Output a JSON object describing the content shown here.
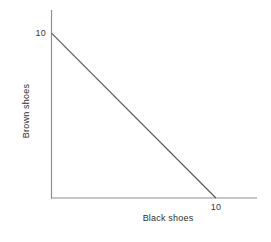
{
  "chart_data": {
    "type": "line",
    "title": "",
    "subtitle": "",
    "xlabel": "Black shoes",
    "ylabel": "Brown shoes",
    "xlim": [
      0,
      12.5
    ],
    "ylim": [
      0,
      11.4
    ],
    "grid": false,
    "legend": null,
    "xticks": [
      {
        "value": 10,
        "label": "10"
      }
    ],
    "yticks": [
      {
        "value": 10,
        "label": "10"
      }
    ],
    "series": [
      {
        "name": "Budget constraint",
        "type": "line",
        "color": "#5a5a5a",
        "linewidth": 1.2,
        "x": [
          0,
          10
        ],
        "y": [
          10,
          0
        ],
        "points": [
          {
            "x": 0,
            "y": 10
          },
          {
            "x": 10,
            "y": 0
          }
        ]
      }
    ],
    "annotations": [],
    "axis_color": "#8f8f8f",
    "background": "#ffffff"
  },
  "axes": {
    "x_tick_10": "10",
    "y_tick_10": "10",
    "x_title": "Black shoes",
    "y_title": "Brown shoes"
  }
}
